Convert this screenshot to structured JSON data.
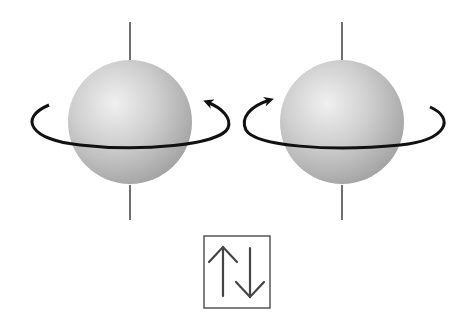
{
  "diagram": {
    "spins": [
      {
        "name": "spin-left",
        "rotation": "counterclockwise",
        "center": [
          130,
          122
        ],
        "radius": 62
      },
      {
        "name": "spin-right",
        "rotation": "clockwise",
        "center": [
          342,
          122
        ],
        "radius": 62
      }
    ],
    "orbital_box": {
      "label": "↑↓",
      "arrows": [
        "up",
        "down"
      ]
    },
    "colors": {
      "sphere_light": "#f2f2f2",
      "sphere_mid": "#c8c8c8",
      "sphere_dark": "#9a9a9a",
      "stroke": "#111111",
      "box": "#555555"
    }
  }
}
